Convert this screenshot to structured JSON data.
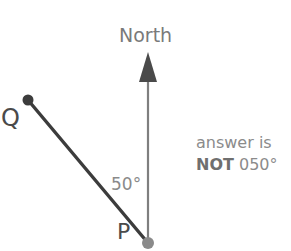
{
  "figure": {
    "title_label": "North",
    "angle_label": "50°",
    "point_p_label": "P",
    "point_q_label": "Q",
    "note": {
      "line1": "answer is",
      "line2_strong": "NOT",
      "line2_rest": " 050°"
    },
    "colors": {
      "background": "#ffffff",
      "ray_pq": "#3c3c3c",
      "north_line": "#7f7f7f",
      "arrow_head": "#4a4a4a",
      "point_q_dot": "#3c3c3c",
      "point_p_dot": "#8a8a8a",
      "label_grey": "#7b7b7b",
      "label_dark": "#4a4a4a"
    },
    "geometry": {
      "point_p": [
        148,
        243
      ],
      "point_q": [
        27,
        100
      ],
      "north_tip": [
        148,
        52
      ],
      "north_line_bottom": [
        148,
        243
      ],
      "angle_degrees": 50
    }
  }
}
